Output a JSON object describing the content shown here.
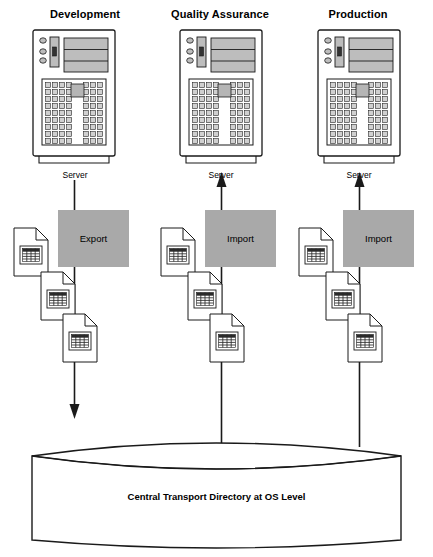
{
  "diagram": {
    "title_present": false,
    "columns": [
      {
        "id": "development",
        "title": "Development",
        "server_label": "Server",
        "transfer_label": "Export",
        "transfer_kind": "export",
        "flow_direction": "down",
        "server_arrow": "none",
        "directory_arrow": "down",
        "document_count": 3
      },
      {
        "id": "quality-assurance",
        "title": "Quality Assurance",
        "server_label": "Server",
        "transfer_label": "Import",
        "transfer_kind": "import",
        "flow_direction": "up",
        "server_arrow": "up",
        "directory_arrow": "none",
        "document_count": 3
      },
      {
        "id": "production",
        "title": "Production",
        "server_label": "Server",
        "transfer_label": "Import",
        "transfer_kind": "import",
        "flow_direction": "up",
        "server_arrow": "up",
        "directory_arrow": "none",
        "document_count": 3
      }
    ],
    "repository": {
      "label": "Central Transport Directory at OS Level",
      "shape": "cylinder"
    },
    "icons": {
      "server": "server-tower-icon",
      "document": "document-with-table-icon",
      "repository": "database-cylinder-icon",
      "arrow_up": "arrow-up-icon",
      "arrow_down": "arrow-down-icon"
    },
    "colors": {
      "transfer_box_fill": "#a9a9a9",
      "server_panel_fill": "#bdbdbd",
      "server_key_fill": "#d0d0d0",
      "stroke": "#1a1a1a",
      "background": "#ffffff"
    }
  }
}
